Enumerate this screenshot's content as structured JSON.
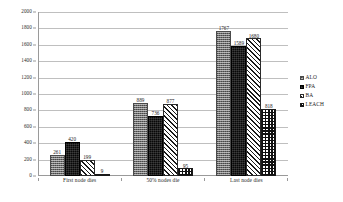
{
  "chart_data": {
    "type": "bar",
    "title": "",
    "subtitle": "",
    "xlabel": "",
    "ylabel": "",
    "ylim": [
      0,
      2000
    ],
    "ytick_step": 200,
    "yticks": [
      "2000",
      "1800",
      "1600",
      "1400",
      "1200",
      "1000",
      "800",
      "600",
      "400",
      "200",
      "0"
    ],
    "grid": true,
    "legend_position": "right",
    "categories": [
      "First node dies",
      "50% nodes die",
      "Last node dies"
    ],
    "series": [
      {
        "name": "ALO",
        "pattern": "gray-dotted",
        "color": "#6e6e6e",
        "values": [
          261,
          889,
          1767
        ],
        "labels": [
          "261",
          "889",
          "1767"
        ]
      },
      {
        "name": "FPA",
        "pattern": "solid-black",
        "color": "#080808",
        "values": [
          420,
          736,
          1589
        ],
        "labels": [
          "420",
          "736",
          "1589"
        ]
      },
      {
        "name": "BA",
        "pattern": "diagonal-hatch",
        "color": "#1a1a1a",
        "values": [
          199,
          877,
          1680
        ],
        "labels": [
          "199",
          "877",
          "1680"
        ]
      },
      {
        "name": "LEACH",
        "pattern": "checkerboard",
        "color": "#111111",
        "values": [
          9,
          95,
          818
        ],
        "labels": [
          "9",
          "95",
          "818"
        ]
      }
    ]
  },
  "legend": {
    "items": [
      {
        "label": "ALO"
      },
      {
        "label": "FPA"
      },
      {
        "label": "BA"
      },
      {
        "label": "LEACH"
      }
    ]
  }
}
